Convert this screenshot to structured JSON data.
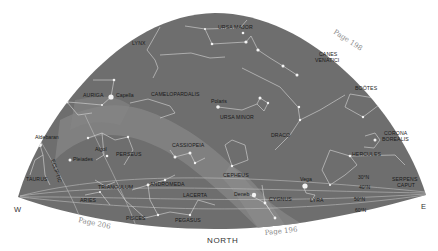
{
  "map": {
    "type": "star-chart",
    "view": "northern sky looking north",
    "colors": {
      "sky": "#6e6e6e",
      "milky_way": "#858585",
      "background": "#ffffff",
      "constellation_lines": "#d8d8d8",
      "stars": "#f4f4f4",
      "label_text": "#1a1a1a",
      "page_ref_text": "#8a8a8a"
    },
    "directions": {
      "west": "W",
      "east": "E",
      "north": "NORTH"
    },
    "page_refs": {
      "top_right": "Page 198",
      "bottom_left": "Page 206",
      "bottom_right": "Page 196"
    },
    "constellations": [
      {
        "name": "URSA MAJOR"
      },
      {
        "name": "LYNX"
      },
      {
        "name": "CANES VENATICI",
        "line1": "CANES",
        "line2": "VENATICI"
      },
      {
        "name": "AURIGA"
      },
      {
        "name": "CAMELOPARDALIS"
      },
      {
        "name": "BOÖTES"
      },
      {
        "name": "URSA MINOR"
      },
      {
        "name": "DRACO"
      },
      {
        "name": "CORONA BOREALIS",
        "line1": "CORONA",
        "line2": "BOREALIS"
      },
      {
        "name": "PERSEUS"
      },
      {
        "name": "CASSIOPEIA"
      },
      {
        "name": "HERCULES"
      },
      {
        "name": "TAURUS"
      },
      {
        "name": "CEPHEUS"
      },
      {
        "name": "TRIANGULUM"
      },
      {
        "name": "ANDROMEDA"
      },
      {
        "name": "SERPENS CAPUT",
        "line1": "SERPENS",
        "line2": "CAPUT"
      },
      {
        "name": "ARIES"
      },
      {
        "name": "LACERTA"
      },
      {
        "name": "CYGNUS"
      },
      {
        "name": "LYRA"
      },
      {
        "name": "PISCES"
      },
      {
        "name": "PEGASUS"
      }
    ],
    "stars": [
      {
        "name": "Capella"
      },
      {
        "name": "Polaris"
      },
      {
        "name": "Aldebaran"
      },
      {
        "name": "Algol"
      },
      {
        "name": "Pleiades"
      },
      {
        "name": "Vega"
      },
      {
        "name": "Deneb"
      }
    ],
    "ecliptic_label": "ECLIPTIC",
    "latitudes": [
      "30°N",
      "40°N",
      "50°N",
      "60°N"
    ]
  }
}
